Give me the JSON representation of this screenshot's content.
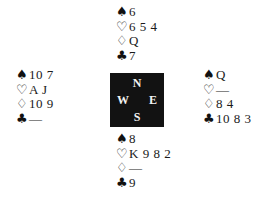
{
  "suits": {
    "spades": "♠",
    "hearts": "♡",
    "diamonds": "♢",
    "clubs": "♣"
  },
  "hands": {
    "north": {
      "spades": "6",
      "hearts": "6 5 4",
      "diamonds": "Q",
      "clubs": "7"
    },
    "west": {
      "spades": "10 7",
      "hearts": "A J",
      "diamonds": "10 9",
      "clubs": "—"
    },
    "east": {
      "spades": "Q",
      "hearts": "—",
      "diamonds": "8 4",
      "clubs": "10 8 3"
    },
    "south": {
      "spades": "8",
      "hearts": "K 9 8 2",
      "diamonds": "—",
      "clubs": "9"
    }
  },
  "compass": {
    "north": "N",
    "south": "S",
    "west": "W",
    "east": "E",
    "background": "#121212",
    "text_color": "#f2f2f2"
  }
}
